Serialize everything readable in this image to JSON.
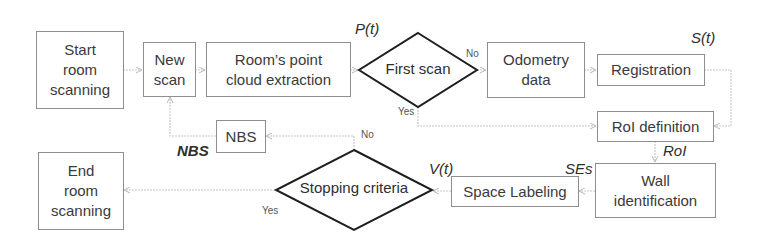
{
  "diagram": {
    "type": "flowchart",
    "nodes": {
      "start": {
        "label": "Start\nroom\nscanning",
        "shape": "rectangle"
      },
      "new_scan": {
        "label": "New\nscan",
        "shape": "rectangle"
      },
      "point_cloud": {
        "label": "Room’s point\ncloud extraction",
        "shape": "rectangle"
      },
      "first_scan": {
        "label": "First scan",
        "shape": "diamond"
      },
      "odometry": {
        "label": "Odometry\ndata",
        "shape": "rectangle"
      },
      "registration": {
        "label": "Registration",
        "shape": "rectangle"
      },
      "roi_definition": {
        "label": "RoI definition",
        "shape": "rectangle"
      },
      "wall_identification": {
        "label": "Wall\nidentification",
        "shape": "rectangle"
      },
      "space_labeling": {
        "label": "Space Labeling",
        "shape": "rectangle"
      },
      "stopping_criteria": {
        "label": "Stopping criteria",
        "shape": "diamond"
      },
      "nbs": {
        "label": "NBS",
        "shape": "rectangle"
      },
      "end": {
        "label": "End\nroom\nscanning",
        "shape": "rectangle"
      }
    },
    "variables": {
      "pt": "P(t)",
      "st": "S(t)",
      "roi": "RoI",
      "ses": "SEs",
      "vt": "V(t)",
      "nbs": "NBS"
    },
    "branch_labels": {
      "first_scan_no": "No",
      "first_scan_yes": "Yes",
      "stopping_no": "No",
      "stopping_yes": "Yes"
    },
    "edges": [
      {
        "from": "start",
        "to": "new_scan"
      },
      {
        "from": "new_scan",
        "to": "point_cloud"
      },
      {
        "from": "point_cloud",
        "to": "first_scan",
        "label": "P(t)"
      },
      {
        "from": "first_scan",
        "to": "odometry",
        "label": "No"
      },
      {
        "from": "first_scan",
        "to": "roi_definition",
        "label": "Yes"
      },
      {
        "from": "odometry",
        "to": "registration"
      },
      {
        "from": "registration",
        "to": "roi_definition",
        "label": "S(t)"
      },
      {
        "from": "roi_definition",
        "to": "wall_identification",
        "label": "RoI"
      },
      {
        "from": "wall_identification",
        "to": "space_labeling",
        "label": "SEs"
      },
      {
        "from": "space_labeling",
        "to": "stopping_criteria",
        "label": "V(t)"
      },
      {
        "from": "stopping_criteria",
        "to": "nbs",
        "label": "No"
      },
      {
        "from": "stopping_criteria",
        "to": "end",
        "label": "Yes"
      },
      {
        "from": "nbs",
        "to": "new_scan",
        "label": "NBS"
      }
    ],
    "colors": {
      "box_border": "#8e8e8e",
      "diamond_border": "#1e1e1e",
      "connector": "#c4c4c4",
      "text": "#3a3a3a"
    }
  }
}
